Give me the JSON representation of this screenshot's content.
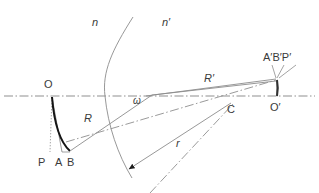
{
  "figure": {
    "background_color": "#ffffff",
    "line_color": "#8c8c8c",
    "emphasis_color": "#1a1a1a",
    "label_color": "#3a3a3a",
    "axis_style": "dash-dot"
  },
  "labels": {
    "medium_left": "n",
    "medium_right": "n′",
    "object_point": "O",
    "object_foot_p": "P",
    "object_foot_a": "A",
    "object_foot_b": "B",
    "ray_R": "R",
    "ray_R_prime": "R′",
    "angle_omega": "ω",
    "radius_r": "r",
    "center_of_curvature": "C",
    "image_axis_point": "O′",
    "image_points": "A′B′P′"
  },
  "geometry": {
    "axis_y": 96,
    "axis_x_start": 4,
    "axis_x_end": 315,
    "object_point": [
      52,
      96
    ],
    "point_P": [
      50,
      150
    ],
    "point_A": [
      62,
      150
    ],
    "point_B": [
      70,
      150
    ],
    "surface_vertex": [
      105,
      96
    ],
    "surface_top": [
      133,
      17
    ],
    "surface_bottom": [
      132,
      178
    ],
    "center_C": [
      232,
      104
    ],
    "image_point": [
      277,
      80
    ],
    "point_O_prime": [
      277,
      96
    ],
    "omega_vertex": [
      150,
      96
    ],
    "arc_arrow_point": [
      127,
      170
    ]
  },
  "label_positions": {
    "medium_left": [
      92,
      26
    ],
    "medium_right": [
      162,
      26
    ],
    "object_point": [
      44,
      88
    ],
    "object_foot_p": [
      38,
      164
    ],
    "object_foot_a": [
      55,
      164
    ],
    "object_foot_b": [
      68,
      164
    ],
    "ray_R": [
      84,
      122
    ],
    "ray_R_prime": [
      205,
      82
    ],
    "angle_omega": [
      133,
      104
    ],
    "radius_r": [
      176,
      146
    ],
    "center_of_curvature": [
      227,
      112
    ],
    "image_axis_point": [
      271,
      110
    ],
    "image_points": [
      264,
      61
    ]
  }
}
